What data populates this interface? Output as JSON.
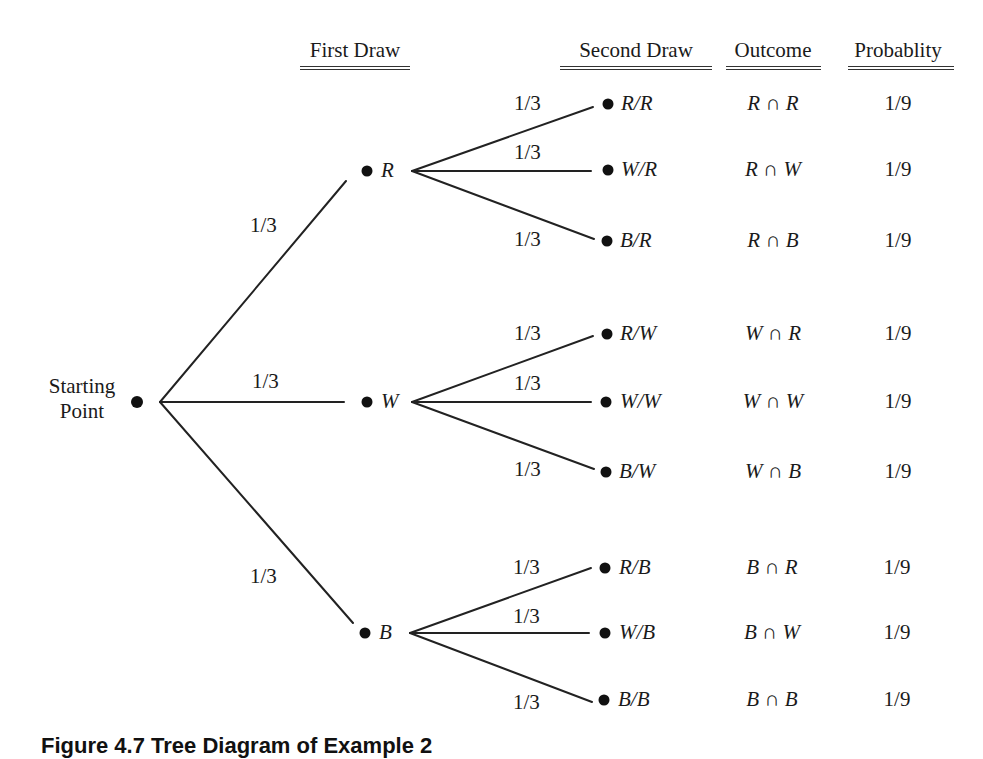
{
  "headers": {
    "first_draw": "First Draw",
    "second_draw": "Second Draw",
    "outcome": "Outcome",
    "probability": "Probablity"
  },
  "start": {
    "line1": "Starting",
    "line2": "Point"
  },
  "first_draw": [
    {
      "label": "R",
      "branch_prob": "1/3"
    },
    {
      "label": "W",
      "branch_prob": "1/3"
    },
    {
      "label": "B",
      "branch_prob": "1/3"
    }
  ],
  "second_draw": [
    {
      "label": "R/R",
      "branch_prob": "1/3",
      "outcome": "R ∩ R",
      "probability": "1/9"
    },
    {
      "label": "W/R",
      "branch_prob": "1/3",
      "outcome": "R ∩ W",
      "probability": "1/9"
    },
    {
      "label": "B/R",
      "branch_prob": "1/3",
      "outcome": "R ∩ B",
      "probability": "1/9"
    },
    {
      "label": "R/W",
      "branch_prob": "1/3",
      "outcome": "W ∩ R",
      "probability": "1/9"
    },
    {
      "label": "W/W",
      "branch_prob": "1/3",
      "outcome": "W ∩ W",
      "probability": "1/9"
    },
    {
      "label": "B/W",
      "branch_prob": "1/3",
      "outcome": "W ∩ B",
      "probability": "1/9"
    },
    {
      "label": "R/B",
      "branch_prob": "1/3",
      "outcome": "B ∩ R",
      "probability": "1/9"
    },
    {
      "label": "W/B",
      "branch_prob": "1/3",
      "outcome": "B ∩ W",
      "probability": "1/9"
    },
    {
      "label": "B/B",
      "branch_prob": "1/3",
      "outcome": "B ∩ B",
      "probability": "1/9"
    }
  ],
  "caption": "Figure 4.7 Tree Diagram of Example 2"
}
